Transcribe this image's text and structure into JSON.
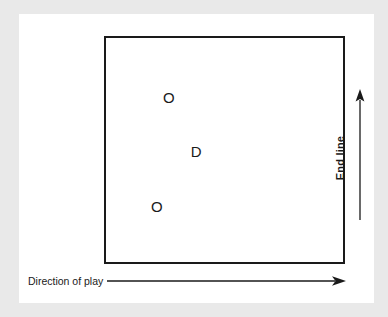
{
  "figure": {
    "background_color": "#e9e9e9",
    "paper_color": "#ffffff",
    "ink_color": "#1a1a1a"
  },
  "court": {
    "name": "playing-area",
    "border_color": "#1a1a1a"
  },
  "markers": [
    {
      "label": "O",
      "role": "offensive-player",
      "x_pct": 26.5,
      "y_pct": 26.5
    },
    {
      "label": "D",
      "role": "defensive-player",
      "x_pct": 38.0,
      "y_pct": 50.5
    },
    {
      "label": "O",
      "role": "offensive-player",
      "x_pct": 21.5,
      "y_pct": 75.0
    }
  ],
  "annotations": {
    "end_line": {
      "label": "End line",
      "orientation": "vertical",
      "arrow_direction": "up"
    },
    "direction_of_play": {
      "label": "Direction of play",
      "orientation": "horizontal",
      "arrow_direction": "right"
    }
  }
}
